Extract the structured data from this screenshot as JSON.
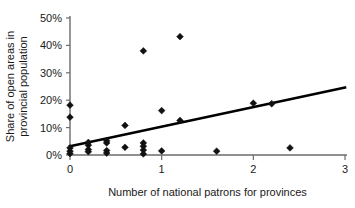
{
  "chart_data": {
    "type": "scatter",
    "title": "",
    "xlabel": "Number of national patrons for provinces",
    "ylabel": "Share of open areas in provincial population",
    "ylabel_line1": "Share of open areas in",
    "ylabel_line2": "provincial population",
    "xlim": [
      0,
      3
    ],
    "ylim": [
      0,
      50
    ],
    "grid": false,
    "legend": null,
    "xticks": [
      0,
      1,
      2,
      3
    ],
    "xtick_labels": [
      "0",
      "1",
      "2",
      "3"
    ],
    "yticks": [
      0,
      10,
      20,
      30,
      40,
      50
    ],
    "ytick_labels": [
      "0%",
      "10%",
      "20%",
      "30%",
      "40%",
      "50%"
    ],
    "marker": "diamond",
    "marker_color": "#111111",
    "points": [
      {
        "x": 0.0,
        "y": 18.2
      },
      {
        "x": 0.0,
        "y": 13.8
      },
      {
        "x": 0.0,
        "y": 2.6
      },
      {
        "x": 0.0,
        "y": 1.4
      },
      {
        "x": 0.0,
        "y": 0.5
      },
      {
        "x": 0.2,
        "y": 4.6
      },
      {
        "x": 0.2,
        "y": 3.6
      },
      {
        "x": 0.2,
        "y": 2.0
      },
      {
        "x": 0.2,
        "y": 1.2
      },
      {
        "x": 0.4,
        "y": 5.2
      },
      {
        "x": 0.4,
        "y": 4.4
      },
      {
        "x": 0.4,
        "y": 1.6
      },
      {
        "x": 0.4,
        "y": 0.7
      },
      {
        "x": 0.6,
        "y": 10.8
      },
      {
        "x": 0.6,
        "y": 2.8
      },
      {
        "x": 0.8,
        "y": 38.0
      },
      {
        "x": 0.8,
        "y": 4.4
      },
      {
        "x": 0.8,
        "y": 3.2
      },
      {
        "x": 0.8,
        "y": 1.8
      },
      {
        "x": 0.8,
        "y": 0.4
      },
      {
        "x": 1.0,
        "y": 16.2
      },
      {
        "x": 1.0,
        "y": 1.5
      },
      {
        "x": 1.2,
        "y": 43.2
      },
      {
        "x": 1.2,
        "y": 12.6
      },
      {
        "x": 1.6,
        "y": 1.4
      },
      {
        "x": 2.0,
        "y": 18.9
      },
      {
        "x": 2.2,
        "y": 18.7
      },
      {
        "x": 2.4,
        "y": 2.6
      }
    ],
    "trendline": {
      "type": "linear",
      "x_start": 0.0,
      "y_start": 3.2,
      "x_end": 3.0,
      "y_end": 24.6
    }
  }
}
